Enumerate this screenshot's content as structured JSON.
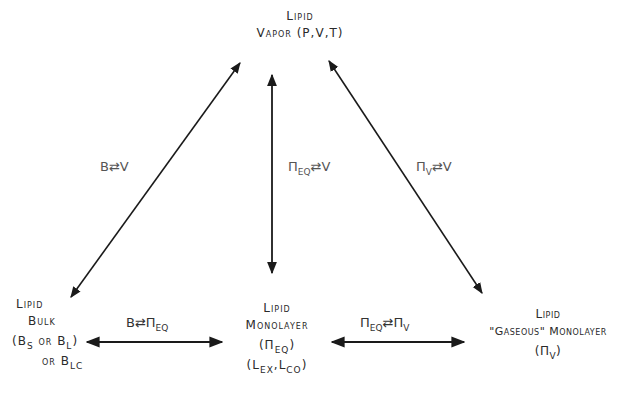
{
  "diagram": {
    "nodes": {
      "vapor": {
        "line1": "Lipid",
        "line2": "Vapor (P,V,T)"
      },
      "bulk": {
        "line1": "Lipid",
        "line2": "Bulk",
        "line3_open": "(B",
        "line3_sub1": "S",
        "line3_mid": " or B",
        "line3_sub2": "L",
        "line3_close": ")",
        "line4_pre": "or B",
        "line4_sub": "LC"
      },
      "monolayer": {
        "line1": "Lipid",
        "line2": "Monolayer",
        "line3_pre": "(Π",
        "line3_sub": "EQ",
        "line3_post": ")",
        "line4_a": "(L",
        "line4_sub1": "EX",
        "line4_b": ",L",
        "line4_sub2": "CO",
        "line4_c": ")"
      },
      "gaseous": {
        "line1": "Lipid",
        "line2": "\"Gaseous\" Monolayer",
        "line3_pre": "(Π",
        "line3_sub": "V",
        "line3_post": ")"
      }
    },
    "edges": {
      "bulk_vapor": {
        "a": "B",
        "arrow": "⇄",
        "b": "V"
      },
      "mono_vapor": {
        "a": "Π",
        "a_sub": "EQ",
        "arrow": "⇄",
        "b": "V"
      },
      "gas_vapor": {
        "a": "Π",
        "a_sub": "V",
        "arrow": "⇄",
        "b": "V"
      },
      "bulk_mono": {
        "a": "B",
        "arrow": "⇄",
        "b": "Π",
        "b_sub": "EQ"
      },
      "mono_gas": {
        "a": "Π",
        "a_sub": "EQ",
        "arrow": "⇄",
        "b": "Π",
        "b_sub": "V"
      }
    },
    "colors": {
      "line": "#1a1a1a",
      "text": "#2a2a2a",
      "label": "#555555"
    }
  }
}
